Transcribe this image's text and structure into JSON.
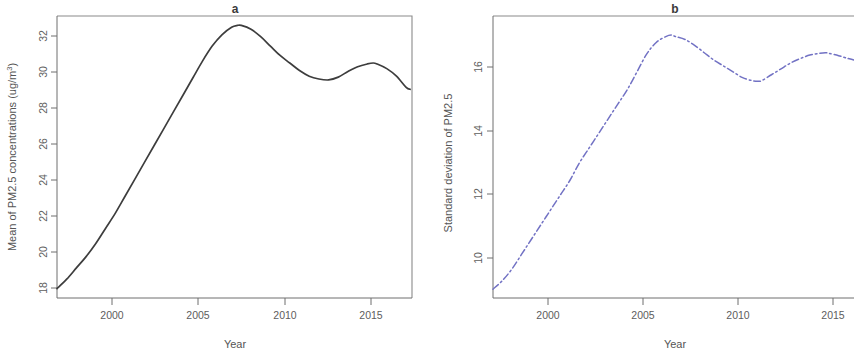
{
  "figure": {
    "width": 854,
    "height": 355,
    "background": "#ffffff"
  },
  "panels": [
    {
      "id": "a",
      "title": "a",
      "xlabel": "Year",
      "ylabel_prefix": "Mean of PM2.5 concentrations  (ug/m",
      "ylabel_sup": "3",
      "ylabel_suffix": ")",
      "ylabel_full": "Mean of PM2.5 concentrations  (ug/m3)",
      "line_color": "#3d3d3d",
      "line_style": "solid",
      "xticks": [
        "2000",
        "2005",
        "2010",
        "2015"
      ],
      "yticks": [
        "18",
        "20",
        "22",
        "24",
        "26",
        "28",
        "30",
        "32"
      ]
    },
    {
      "id": "b",
      "title": "b",
      "xlabel": "Year",
      "ylabel_prefix": "Standard deviation of PM2.5",
      "ylabel_sup": "",
      "ylabel_suffix": "",
      "ylabel_full": "Standard deviation of PM2.5",
      "line_color": "#7272c4",
      "line_style": "dashdot",
      "xticks": [
        "2000",
        "2005",
        "2010",
        "2015"
      ],
      "yticks": [
        "10",
        "12",
        "14",
        "16"
      ]
    }
  ],
  "chart_data": [
    {
      "type": "line",
      "panel": "a",
      "title": "a",
      "xlabel": "Year",
      "ylabel": "Mean of PM2.5 concentrations  (ug/m3)",
      "xlim": [
        1998,
        2016.3
      ],
      "ylim": [
        18,
        33
      ],
      "xticks": [
        2000,
        2005,
        2010,
        2015
      ],
      "yticks": [
        18,
        20,
        22,
        24,
        26,
        28,
        30,
        32
      ],
      "grid": false,
      "legend": "none",
      "line_color": "#3d3d3d",
      "line_style": "solid",
      "x": [
        1998.0,
        1998.5,
        1999.0,
        1999.5,
        2000.0,
        2000.5,
        2001.0,
        2001.5,
        2002.0,
        2002.5,
        2003.0,
        2003.5,
        2004.0,
        2004.5,
        2005.0,
        2005.5,
        2006.0,
        2006.5,
        2007.0,
        2007.3,
        2007.5,
        2008.0,
        2008.5,
        2009.0,
        2009.5,
        2010.0,
        2010.5,
        2011.0,
        2011.5,
        2012.0,
        2012.5,
        2013.0,
        2013.5,
        2014.0,
        2014.3,
        2014.5,
        2015.0,
        2015.5,
        2016.0,
        2016.2
      ],
      "y": [
        18.5,
        19.0,
        19.6,
        20.2,
        20.9,
        21.7,
        22.5,
        23.4,
        24.3,
        25.2,
        26.1,
        27.0,
        27.9,
        28.8,
        29.7,
        30.6,
        31.4,
        32.0,
        32.4,
        32.5,
        32.5,
        32.3,
        31.9,
        31.4,
        30.9,
        30.5,
        30.1,
        29.8,
        29.65,
        29.6,
        29.75,
        30.05,
        30.3,
        30.45,
        30.5,
        30.45,
        30.2,
        29.8,
        29.2,
        29.1
      ]
    },
    {
      "type": "line",
      "panel": "b",
      "title": "b",
      "xlabel": "Year",
      "ylabel": "Standard deviation of PM2.5",
      "xlim": [
        1998,
        2016.8
      ],
      "ylim": [
        8.6,
        18.2
      ],
      "xticks": [
        2000,
        2005,
        2010,
        2015
      ],
      "yticks": [
        10,
        12,
        14,
        16
      ],
      "grid": false,
      "legend": "none",
      "line_color": "#7272c4",
      "line_style": "dashdot",
      "x": [
        1998.0,
        1998.5,
        1999.0,
        1999.5,
        2000.0,
        2000.5,
        2001.0,
        2001.5,
        2002.0,
        2002.5,
        2003.0,
        2003.5,
        2004.0,
        2004.5,
        2005.0,
        2005.5,
        2006.0,
        2006.5,
        2007.0,
        2007.3,
        2007.5,
        2008.0,
        2008.5,
        2009.0,
        2009.5,
        2010.0,
        2010.5,
        2011.0,
        2011.5,
        2011.8,
        2012.0,
        2012.5,
        2013.0,
        2013.5,
        2014.0,
        2014.5,
        2015.0,
        2015.3,
        2015.5,
        2016.0,
        2016.5,
        2016.8
      ],
      "y": [
        8.9,
        9.2,
        9.6,
        10.1,
        10.6,
        11.1,
        11.6,
        12.1,
        12.6,
        13.2,
        13.7,
        14.2,
        14.7,
        15.2,
        15.7,
        16.3,
        16.9,
        17.3,
        17.5,
        17.55,
        17.5,
        17.4,
        17.2,
        16.95,
        16.7,
        16.5,
        16.3,
        16.1,
        16.0,
        15.98,
        16.0,
        16.2,
        16.4,
        16.6,
        16.75,
        16.87,
        16.93,
        16.95,
        16.93,
        16.85,
        16.75,
        16.7
      ]
    }
  ]
}
